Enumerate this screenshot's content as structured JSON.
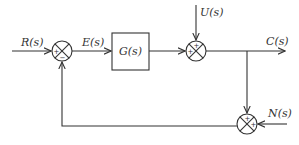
{
  "diagram": {
    "type": "control-system-block-diagram",
    "signals": {
      "input": "R(s)",
      "error": "E(s)",
      "disturbance": "U(s)",
      "output": "C(s)",
      "noise": "N(s)"
    },
    "blocks": [
      {
        "id": "G",
        "label": "G(s)"
      }
    ],
    "summing_junctions": [
      {
        "id": "sum1",
        "signs": {
          "left": "+",
          "bottom": "−"
        }
      },
      {
        "id": "sum2",
        "signs": {
          "top": "+",
          "left": "+"
        }
      },
      {
        "id": "sum3",
        "signs": {
          "top": "+",
          "right": "+"
        }
      }
    ],
    "connections": [
      {
        "from": "R(s)",
        "to": "sum1"
      },
      {
        "from": "sum1",
        "to": "G",
        "label": "E(s)"
      },
      {
        "from": "G",
        "to": "sum2"
      },
      {
        "from": "U(s)",
        "to": "sum2"
      },
      {
        "from": "sum2",
        "to": "C(s)"
      },
      {
        "from": "C(s)",
        "to": "sum3"
      },
      {
        "from": "N(s)",
        "to": "sum3"
      },
      {
        "from": "sum3",
        "to": "sum1",
        "type": "feedback"
      }
    ]
  }
}
